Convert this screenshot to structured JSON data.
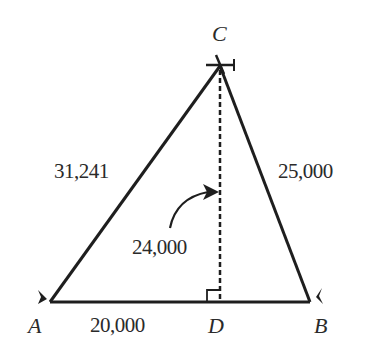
{
  "diagram": {
    "type": "triangle-with-altitude",
    "vertices": {
      "A": {
        "label": "A"
      },
      "B": {
        "label": "B"
      },
      "C": {
        "label": "C"
      },
      "D": {
        "label": "D"
      }
    },
    "lengths": {
      "AC": "31,241",
      "CB": "25,000",
      "CD": "24,000",
      "AD": "20,000"
    },
    "annotations": {
      "right_angle_at": "D",
      "altitude": "CD (dashed)",
      "arrow": "curved arrow from 24,000 label to altitude CD"
    },
    "colors": {
      "line": "#1e1e1e",
      "text": "#2a2a2a",
      "background": "#ffffff"
    }
  }
}
